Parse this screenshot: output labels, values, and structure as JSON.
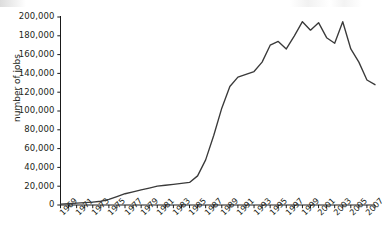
{
  "chart_data": {
    "type": "line",
    "title": "",
    "xlabel": "",
    "ylabel": "number of jobs",
    "xlim": [
      1969,
      2008
    ],
    "ylim": [
      0,
      200000
    ],
    "grid": false,
    "legend": null,
    "y_ticks": [
      0,
      20000,
      40000,
      60000,
      80000,
      100000,
      120000,
      140000,
      160000,
      180000,
      200000
    ],
    "y_tick_labels": [
      "0",
      "20,000",
      "40,000",
      "60,000",
      "80,000",
      "100,000",
      "120,000",
      "140,000",
      "160,000",
      "180,000",
      "200,000"
    ],
    "x_tick_labels": [
      "1969",
      "1971",
      "1973",
      "1975",
      "1977",
      "1979",
      "1981",
      "1983",
      "1985",
      "1987",
      "1989",
      "1991",
      "1993",
      "1995",
      "1997",
      "1999",
      "2001",
      "2003",
      "2005",
      "2007"
    ],
    "x": [
      1969,
      1970,
      1971,
      1972,
      1973,
      1974,
      1975,
      1976,
      1977,
      1978,
      1979,
      1980,
      1981,
      1982,
      1983,
      1984,
      1985,
      1986,
      1987,
      1988,
      1989,
      1990,
      1991,
      1992,
      1993,
      1994,
      1995,
      1996,
      1997,
      1998,
      1999,
      2000,
      2001,
      2002,
      2003,
      2004,
      2005,
      2006,
      2007,
      2008
    ],
    "values": [
      1000,
      1500,
      2000,
      2500,
      3000,
      4000,
      6000,
      9000,
      12000,
      14000,
      16000,
      18000,
      20000,
      21000,
      22000,
      23000,
      24000,
      31000,
      48000,
      74000,
      103000,
      126000,
      136000,
      139000,
      142000,
      152000,
      170000,
      174000,
      166000,
      180000,
      195000,
      186000,
      194000,
      178000,
      172000,
      195000,
      166000,
      152000,
      133000,
      128000
    ],
    "series": [
      {
        "name": "number of jobs",
        "color": "#3a3a3a",
        "values": [
          1000,
          1500,
          2000,
          2500,
          3000,
          4000,
          6000,
          9000,
          12000,
          14000,
          16000,
          18000,
          20000,
          21000,
          22000,
          23000,
          24000,
          31000,
          48000,
          74000,
          103000,
          126000,
          136000,
          139000,
          142000,
          152000,
          170000,
          174000,
          166000,
          180000,
          195000,
          186000,
          194000,
          178000,
          172000,
          195000,
          166000,
          152000,
          133000,
          128000
        ]
      }
    ]
  },
  "colors": {
    "line": "#3a3a3a",
    "axis": "#1a1a1a",
    "text": "#231f20",
    "background": "#ffffff"
  }
}
